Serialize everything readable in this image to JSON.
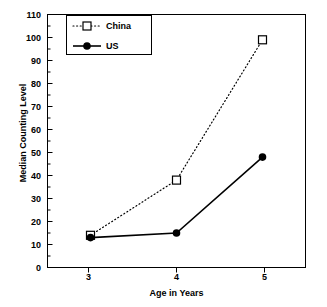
{
  "chart_data": {
    "type": "line",
    "title": "",
    "xlabel": "Age in Years",
    "ylabel": "Median Counting Level",
    "x": [
      3,
      4,
      5
    ],
    "xtick_labels": [
      "3",
      "4",
      "5"
    ],
    "ytick_labels": [
      "0",
      "10",
      "20",
      "30",
      "40",
      "50",
      "60",
      "70",
      "80",
      "90",
      "100",
      "110"
    ],
    "yticks": [
      0,
      10,
      20,
      30,
      40,
      50,
      60,
      70,
      80,
      90,
      100,
      110
    ],
    "xlim": [
      2.5,
      5.5
    ],
    "ylim": [
      0,
      110
    ],
    "grid": false,
    "legend_position": "upper left",
    "series": [
      {
        "name": "China",
        "values": [
          14,
          38,
          99
        ],
        "line_style": "dotted",
        "marker": "open-square",
        "color": "#000000"
      },
      {
        "name": "US",
        "values": [
          13,
          15,
          48
        ],
        "line_style": "solid",
        "marker": "filled-circle",
        "color": "#000000"
      }
    ]
  },
  "legend": {
    "entries": [
      {
        "label": "China"
      },
      {
        "label": "US"
      }
    ]
  },
  "icons": {
    "open_square_marker": "open-square-marker",
    "filled_circle_marker": "filled-circle-marker"
  }
}
